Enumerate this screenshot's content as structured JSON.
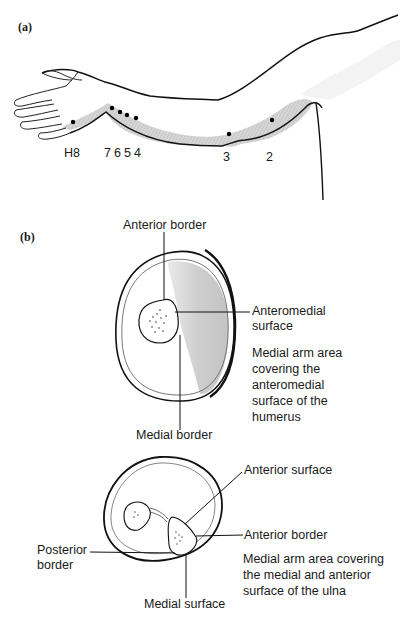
{
  "figure": {
    "panel_a": {
      "label": "(a)",
      "points": [
        {
          "id": "H8",
          "label": "H8"
        },
        {
          "id": "7",
          "label": "7"
        },
        {
          "id": "6",
          "label": "6"
        },
        {
          "id": "5",
          "label": "5"
        },
        {
          "id": "4",
          "label": "4"
        },
        {
          "id": "3",
          "label": "3"
        },
        {
          "id": "2",
          "label": "2"
        }
      ]
    },
    "panel_b": {
      "label": "(b)",
      "humerus": {
        "anterior_border": "Anterior border",
        "anteromedial_surface": "Anteromedial\nsurface",
        "medial_border": "Medial border",
        "caption": "Medial arm area\ncovering the\nanteromedial\nsurface of the\nhumerus"
      },
      "ulna": {
        "anterior_surface": "Anterior surface",
        "anterior_border": "Anterior border",
        "posterior_border": "Posterior\nborder",
        "medial_surface": "Medial surface",
        "caption": "Medial arm area covering\nthe medial and anterior\nsurface of the ulna"
      }
    }
  }
}
